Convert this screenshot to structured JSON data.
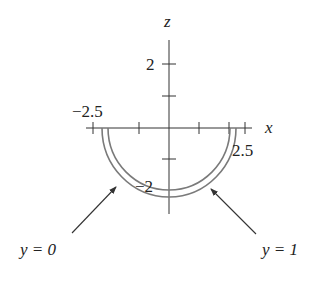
{
  "figure": {
    "axes": {
      "x_label": "x",
      "z_label": "z",
      "x_ticks": [
        "−2.5",
        "2.5"
      ],
      "z_ticks": [
        "2",
        "−2"
      ]
    },
    "curves": [
      {
        "name": "y = 0",
        "label": "y = 0",
        "shape": "lower semicircle",
        "radius_units": 2.5
      },
      {
        "name": "y = 1",
        "label": "y = 1",
        "shape": "lower semicircle",
        "radius_units": 2.25
      }
    ],
    "annotations": {
      "left_label": "y = 0",
      "right_label": "y = 1"
    },
    "colors": {
      "axis": "#333333",
      "curve": "#7a7a7a",
      "text": "#222222"
    }
  }
}
